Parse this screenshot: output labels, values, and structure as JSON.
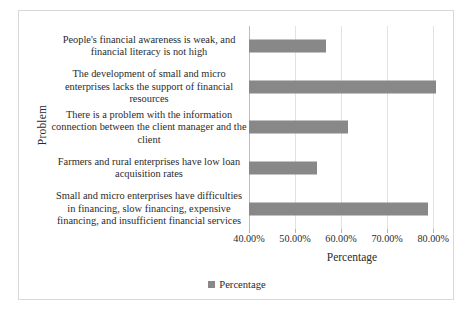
{
  "chart_data": {
    "type": "bar",
    "orientation": "horizontal",
    "title": "",
    "xlabel": "Percentage",
    "ylabel": "Problem",
    "xlim": [
      40,
      83
    ],
    "xticks": [
      40,
      50,
      60,
      70,
      80
    ],
    "xtick_labels": [
      "40.00%",
      "50.00%",
      "60.00%",
      "70.00%",
      "80.00%"
    ],
    "grid": true,
    "legend": {
      "position": "bottom",
      "entries": [
        {
          "name": "Percentage",
          "color": "#888888"
        }
      ]
    },
    "series": [
      {
        "name": "Percentage",
        "color": "#888888",
        "values": [
          56.7,
          80.7,
          61.5,
          54.8,
          78.8
        ]
      }
    ],
    "categories": [
      "People's financial awareness is weak, and financial literacy is not high",
      "The development of small and micro enterprises lacks the support of financial resources",
      "There is a problem with the information connection between the client manager and the client",
      "Farmers and rural enterprises have low loan acquisition rates",
      "Small and micro enterprises have difficulties in financing, slow financing, expensive financing, and insufficient financial services"
    ]
  },
  "legend": {
    "label": "Percentage"
  },
  "axes": {
    "x_title": "Percentage",
    "y_title": "Problem"
  }
}
